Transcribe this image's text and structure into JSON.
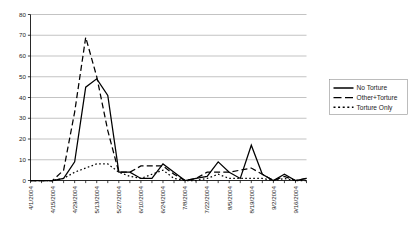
{
  "chart_data": {
    "type": "line",
    "title": "",
    "xlabel": "",
    "ylabel": "",
    "ylim": [
      0,
      80
    ],
    "ytick_step": 10,
    "yticks": [
      "0",
      "10",
      "20",
      "30",
      "40",
      "50",
      "60",
      "70",
      "80"
    ],
    "grid": true,
    "legend_position": "right",
    "x": [
      "4/1/2004",
      "4/8/2004",
      "4/15/2004",
      "4/22/2004",
      "4/29/2004",
      "5/6/2004",
      "5/13/2004",
      "5/20/2004",
      "5/27/2004",
      "6/3/2004",
      "6/10/2004",
      "6/17/2004",
      "6/24/2004",
      "7/1/2004",
      "7/8/2004",
      "7/15/2004",
      "7/22/2004",
      "7/29/2004",
      "8/5/2004",
      "8/12/2004",
      "8/19/2004",
      "8/26/2004",
      "9/2/2004",
      "9/9/2004",
      "9/16/2004",
      "9/23/2004"
    ],
    "xtick_labels": [
      "4/1/2004",
      "",
      "4/15/2004",
      "",
      "4/29/2004",
      "",
      "5/13/2004",
      "",
      "5/27/2004",
      "",
      "6/10/2004",
      "",
      "6/24/2004",
      "",
      "7/8/2004",
      "",
      "7/22/2004",
      "",
      "8/5/2004",
      "",
      "8/19/2004",
      "",
      "9/2/2004",
      "",
      "9/16/2004",
      ""
    ],
    "series": [
      {
        "name": "No Torture",
        "style": "solid",
        "color": "#000000",
        "values": [
          0,
          0,
          0,
          1,
          9,
          45,
          49,
          41,
          4,
          4,
          1,
          1,
          8,
          4,
          0,
          1,
          2,
          9,
          4,
          1,
          17,
          3,
          0,
          3,
          0,
          1
        ]
      },
      {
        "name": "Other+Torture",
        "style": "dashed",
        "color": "#000000",
        "values": [
          0,
          0,
          0,
          5,
          33,
          69,
          50,
          24,
          4,
          4,
          7,
          7,
          7,
          3,
          0,
          1,
          4,
          4,
          4,
          5,
          6,
          3,
          0,
          2,
          0,
          1
        ]
      },
      {
        "name": "Torture Only",
        "style": "dotted",
        "color": "#000000",
        "values": [
          0,
          0,
          0,
          1,
          4,
          6,
          8,
          8,
          4,
          2,
          1,
          3,
          5,
          1,
          0,
          0,
          1,
          3,
          1,
          1,
          1,
          1,
          0,
          1,
          0,
          0
        ]
      }
    ]
  },
  "legend": {
    "entries": [
      {
        "label": "No Torture"
      },
      {
        "label": "Other+Torture"
      },
      {
        "label": "Torture Only"
      }
    ]
  }
}
